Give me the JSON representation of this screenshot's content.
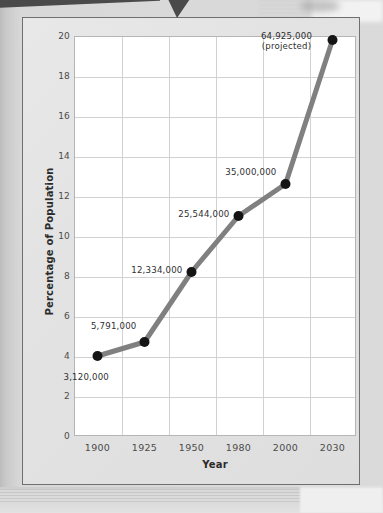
{
  "chart_data": {
    "type": "line",
    "title": "",
    "xlabel": "Year",
    "ylabel": "Percentage of Population",
    "categories": [
      "1900",
      "1925",
      "1950",
      "1980",
      "2000",
      "2030"
    ],
    "values": [
      4.0,
      4.7,
      8.2,
      11.0,
      12.6,
      19.8
    ],
    "point_labels": [
      "3,120,000",
      "5,791,000",
      "12,334,000",
      "25,544,000",
      "35,000,000",
      "64,925,000"
    ],
    "annotations": [
      "(projected)"
    ],
    "ylim": [
      0,
      20
    ],
    "y_ticks": [
      "0",
      "2",
      "4",
      "6",
      "8",
      "10",
      "12",
      "14",
      "16",
      "18",
      "20"
    ],
    "y_tick_values": [
      0,
      2,
      4,
      6,
      8,
      10,
      12,
      14,
      16,
      18,
      20
    ],
    "x_ticks": [
      "1900",
      "1925",
      "1950",
      "1980",
      "2000",
      "2030"
    ],
    "grid": true,
    "legend": "none",
    "series": [
      {
        "name": "Percentage of Population",
        "values": [
          4.0,
          4.7,
          8.2,
          11.0,
          12.6,
          19.8
        ],
        "labels": [
          "3,120,000",
          "5,791,000",
          "12,334,000",
          "25,544,000",
          "35,000,000",
          "64,925,000"
        ]
      }
    ],
    "colors": {
      "line": "#808080",
      "marker": "#141414",
      "grid": "#d2d2d2",
      "plot_background": "#ffffff",
      "card_background": "#e4e4e4",
      "text": "#2f2f2f"
    }
  }
}
